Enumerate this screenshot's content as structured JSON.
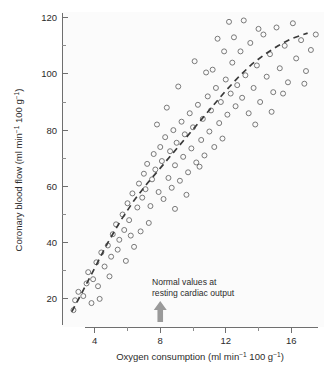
{
  "chart_data": {
    "type": "scatter",
    "title": "",
    "xlabel": "Oxygen consumption (ml min⁻¹ 100 g⁻¹)",
    "ylabel": "Coronary blood flow (ml min⁻¹ 100 g⁻¹)",
    "xlim": [
      2,
      18
    ],
    "ylim": [
      10,
      122
    ],
    "xticks": [
      4,
      8,
      12,
      16
    ],
    "yticks": [
      20,
      40,
      60,
      80,
      100,
      120
    ],
    "xminorticks": [
      2,
      6,
      10,
      14,
      18
    ],
    "yminorticks": [
      30,
      50,
      70,
      90,
      110
    ],
    "grid": false,
    "legend": null,
    "marker": "open-circle",
    "annotations": [
      {
        "text_line1": "Normal values at",
        "text_line2": "resting cardiac output",
        "arrow": "up-arrow",
        "arrow_x": 8,
        "arrow_color": "#9a9a9a"
      }
    ],
    "trend_line": {
      "style": "dashed",
      "color": "#3a3a3a",
      "points": [
        [
          2.6,
          15.5
        ],
        [
          3.2,
          22.0
        ],
        [
          4.0,
          31.0
        ],
        [
          4.8,
          40.0
        ],
        [
          5.6,
          48.0
        ],
        [
          6.4,
          55.0
        ],
        [
          7.2,
          61.0
        ],
        [
          8.0,
          66.5
        ],
        [
          8.8,
          72.0
        ],
        [
          9.6,
          77.5
        ],
        [
          10.4,
          83.0
        ],
        [
          11.2,
          88.5
        ],
        [
          12.0,
          94.0
        ],
        [
          12.8,
          99.0
        ],
        [
          13.6,
          103.5
        ],
        [
          14.4,
          107.0
        ],
        [
          15.2,
          110.0
        ],
        [
          16.0,
          112.5
        ],
        [
          17.0,
          114.5
        ]
      ]
    },
    "points": [
      [
        2.7,
        16.0
      ],
      [
        2.8,
        19.5
      ],
      [
        3.0,
        22.5
      ],
      [
        3.3,
        21.0
      ],
      [
        3.5,
        25.5
      ],
      [
        3.6,
        29.5
      ],
      [
        3.9,
        27.0
      ],
      [
        4.1,
        33.0
      ],
      [
        4.3,
        20.0
      ],
      [
        4.4,
        36.5
      ],
      [
        4.6,
        31.5
      ],
      [
        4.8,
        39.0
      ],
      [
        5.0,
        35.0
      ],
      [
        5.1,
        43.0
      ],
      [
        5.3,
        46.5
      ],
      [
        5.5,
        41.0
      ],
      [
        5.7,
        50.0
      ],
      [
        5.8,
        44.5
      ],
      [
        6.0,
        54.0
      ],
      [
        6.1,
        48.0
      ],
      [
        6.3,
        57.5
      ],
      [
        6.4,
        38.5
      ],
      [
        6.6,
        52.5
      ],
      [
        6.7,
        61.0
      ],
      [
        6.9,
        56.0
      ],
      [
        7.0,
        64.5
      ],
      [
        7.1,
        59.0
      ],
      [
        7.2,
        68.0
      ],
      [
        7.3,
        47.0
      ],
      [
        7.5,
        62.5
      ],
      [
        7.6,
        71.5
      ],
      [
        7.7,
        66.0
      ],
      [
        7.9,
        58.0
      ],
      [
        8.0,
        74.0
      ],
      [
        8.1,
        69.0
      ],
      [
        8.2,
        55.5
      ],
      [
        8.3,
        77.5
      ],
      [
        8.5,
        63.0
      ],
      [
        8.6,
        72.5
      ],
      [
        8.7,
        59.5
      ],
      [
        8.8,
        80.0
      ],
      [
        8.9,
        67.5
      ],
      [
        9.0,
        75.5
      ],
      [
        9.2,
        62.0
      ],
      [
        9.3,
        83.0
      ],
      [
        9.4,
        70.5
      ],
      [
        9.5,
        78.5
      ],
      [
        9.7,
        65.0
      ],
      [
        9.8,
        86.0
      ],
      [
        9.9,
        73.5
      ],
      [
        10.0,
        81.0
      ],
      [
        10.2,
        68.5
      ],
      [
        10.3,
        89.0
      ],
      [
        10.5,
        76.5
      ],
      [
        10.6,
        84.0
      ],
      [
        10.7,
        71.0
      ],
      [
        10.9,
        92.0
      ],
      [
        11.0,
        79.5
      ],
      [
        11.1,
        87.0
      ],
      [
        11.3,
        74.0
      ],
      [
        11.4,
        95.0
      ],
      [
        11.6,
        82.5
      ],
      [
        11.7,
        90.0
      ],
      [
        11.8,
        77.0
      ],
      [
        12.0,
        98.0
      ],
      [
        12.1,
        85.5
      ],
      [
        12.3,
        93.0
      ],
      [
        12.4,
        104.0
      ],
      [
        12.6,
        88.5
      ],
      [
        12.7,
        96.0
      ],
      [
        12.9,
        108.0
      ],
      [
        13.0,
        91.5
      ],
      [
        13.2,
        99.5
      ],
      [
        13.4,
        86.0
      ],
      [
        13.5,
        111.0
      ],
      [
        13.7,
        95.0
      ],
      [
        13.9,
        103.0
      ],
      [
        14.1,
        90.0
      ],
      [
        14.3,
        114.0
      ],
      [
        14.5,
        99.0
      ],
      [
        14.7,
        107.0
      ],
      [
        14.9,
        93.5
      ],
      [
        15.1,
        116.5
      ],
      [
        15.3,
        102.0
      ],
      [
        15.6,
        110.0
      ],
      [
        15.8,
        97.0
      ],
      [
        16.1,
        118.0
      ],
      [
        16.3,
        105.5
      ],
      [
        16.6,
        112.0
      ],
      [
        16.9,
        101.0
      ],
      [
        17.2,
        108.5
      ],
      [
        17.5,
        114.0
      ],
      [
        12.2,
        118.5
      ],
      [
        13.1,
        119.0
      ],
      [
        11.5,
        112.5
      ],
      [
        14.0,
        116.0
      ],
      [
        10.1,
        104.5
      ],
      [
        11.9,
        108.0
      ],
      [
        9.1,
        95.5
      ],
      [
        10.8,
        100.5
      ],
      [
        8.4,
        88.0
      ],
      [
        7.8,
        82.0
      ],
      [
        9.6,
        57.0
      ],
      [
        8.9,
        52.0
      ],
      [
        10.4,
        67.0
      ],
      [
        11.2,
        101.5
      ],
      [
        12.5,
        113.0
      ],
      [
        6.8,
        44.0
      ],
      [
        5.9,
        33.5
      ],
      [
        7.4,
        53.0
      ],
      [
        4.9,
        28.0
      ],
      [
        4.2,
        24.5
      ],
      [
        3.8,
        18.5
      ],
      [
        5.4,
        37.5
      ],
      [
        6.2,
        42.5
      ],
      [
        16.8,
        96.5
      ],
      [
        15.5,
        93.0
      ],
      [
        14.8,
        86.5
      ],
      [
        13.8,
        82.0
      ]
    ]
  }
}
